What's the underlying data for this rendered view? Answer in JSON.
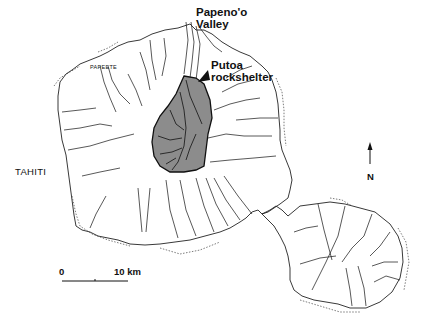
{
  "map": {
    "title": "Tahiti",
    "labels": {
      "island": "TAHITI",
      "town": "PAPEETE",
      "valley_line1": "Papeno'o",
      "valley_line2": "Valley",
      "site_line1": "Putoa",
      "site_line2": "rockshelter"
    },
    "north_arrow": {
      "label": "N",
      "icon": "north-arrow-icon"
    },
    "scale_bar": {
      "start_label": "0",
      "end_label": "10 km"
    },
    "colors": {
      "ink": "#111111",
      "shaded_valley": "#8c8c8c",
      "background": "#ffffff"
    }
  }
}
